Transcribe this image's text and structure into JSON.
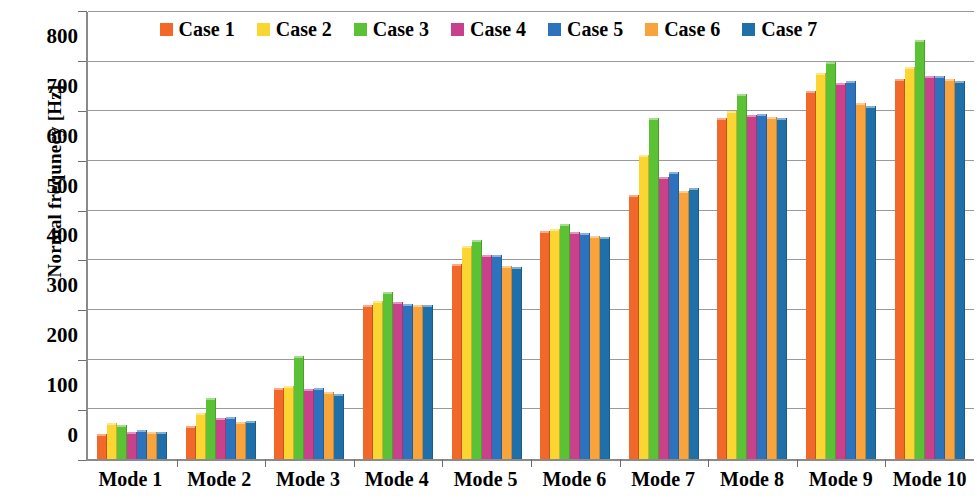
{
  "chart_data": {
    "type": "bar",
    "title": "",
    "xlabel": "",
    "ylabel": "Normal frequnecy [Hz]",
    "ylim": [
      0,
      900
    ],
    "ytick_step": 100,
    "yticks": [
      0,
      100,
      200,
      300,
      400,
      500,
      600,
      700,
      800,
      900
    ],
    "ytick_labels": [
      "0",
      "100",
      "200",
      "300",
      "400",
      "500",
      "600",
      "700",
      "800",
      "900"
    ],
    "grid": true,
    "legend_position": "top-center",
    "categories": [
      "Mode 1",
      "Mode 2",
      "Mode 3",
      "Mode 4",
      "Mode 5",
      "Mode 6",
      "Mode 7",
      "Mode 8",
      "Mode 9",
      "Mode 10"
    ],
    "series": [
      {
        "name": "Case 1",
        "color": "#F2672A",
        "values": [
          50,
          67,
          142,
          311,
          393,
          459,
          532,
          687,
          741,
          766
        ]
      },
      {
        "name": "Case 2",
        "color": "#FBD531",
        "values": [
          72,
          92,
          148,
          318,
          428,
          463,
          612,
          700,
          777,
          790
        ]
      },
      {
        "name": "Case 3",
        "color": "#5CC235",
        "values": [
          68,
          123,
          207,
          337,
          440,
          474,
          686,
          734,
          800,
          843
        ]
      },
      {
        "name": "Case 4",
        "color": "#C9418B",
        "values": [
          55,
          82,
          141,
          317,
          411,
          457,
          568,
          692,
          757,
          771
        ]
      },
      {
        "name": "Case 5",
        "color": "#2C72BC",
        "values": [
          58,
          85,
          142,
          313,
          411,
          455,
          577,
          694,
          762,
          771
        ]
      },
      {
        "name": "Case 6",
        "color": "#F8A33C",
        "values": [
          55,
          75,
          134,
          311,
          388,
          449,
          540,
          688,
          716,
          765
        ]
      },
      {
        "name": "Case 7",
        "color": "#1F6FA8",
        "values": [
          55,
          77,
          131,
          310,
          386,
          448,
          546,
          687,
          710,
          762
        ]
      }
    ]
  }
}
